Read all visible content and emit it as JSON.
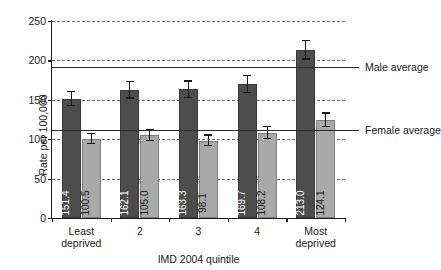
{
  "chart_data": {
    "type": "bar",
    "title": "",
    "xlabel": "IMD 2004 quintile",
    "ylabel": "Rate per 100,000",
    "categories": [
      "Least deprived",
      "2",
      "3",
      "4",
      "Most deprived"
    ],
    "category_lines": [
      [
        "Least",
        "deprived"
      ],
      [
        "2",
        ""
      ],
      [
        "3",
        ""
      ],
      [
        "4",
        ""
      ],
      [
        "Most",
        "deprived"
      ]
    ],
    "ylim": [
      0,
      250
    ],
    "yticks": [
      0,
      50,
      100,
      150,
      200,
      250
    ],
    "ytick_labels": [
      "0",
      "50",
      "100",
      "150",
      "200",
      "250"
    ],
    "grid": true,
    "legend": "none",
    "series": [
      {
        "name": "Male",
        "color": "#4d4d4d",
        "values": [
          151.4,
          162.1,
          163.3,
          169.7,
          213.0
        ],
        "labels": [
          "151.4",
          "162.1",
          "163.3",
          "169.7",
          "213.0"
        ],
        "errors_low": [
          142.0,
          151.5,
          152.5,
          158.5,
          201.0
        ],
        "errors_high": [
          161.5,
          173.5,
          174.5,
          181.5,
          225.5
        ]
      },
      {
        "name": "Female",
        "color": "#a9a9a9",
        "values": [
          100.5,
          105.0,
          98.1,
          108.2,
          124.1
        ],
        "labels": [
          "100.5",
          "105.0",
          "98.1",
          "108.2",
          "124.1"
        ],
        "errors_low": [
          93.5,
          97.5,
          91.0,
          100.5,
          115.0
        ],
        "errors_high": [
          108.5,
          113.0,
          106.0,
          116.5,
          134.0
        ]
      }
    ],
    "reference_lines": [
      {
        "label": "Male average",
        "value": 191.0
      },
      {
        "label": "Female average",
        "value": 112.0
      }
    ]
  }
}
